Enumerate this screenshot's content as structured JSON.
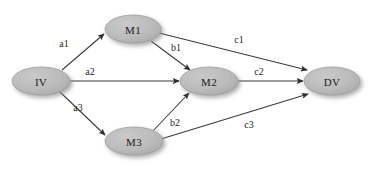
{
  "diagram": {
    "type": "path-analysis-mediation-model",
    "background_color": "#ffffff",
    "node_fill_color": "#b9b9b9",
    "node_stroke_color": "#9a9a9a",
    "edge_color": "#3a3a3a",
    "label_color": "#1a1a1a",
    "nodes": [
      {
        "id": "IV",
        "label": "IV",
        "cx": 41,
        "cy": 81,
        "rx": 29,
        "ry": 14
      },
      {
        "id": "M1",
        "label": "M1",
        "cx": 133,
        "cy": 29,
        "rx": 28,
        "ry": 14
      },
      {
        "id": "M2",
        "label": "M2",
        "cx": 209,
        "cy": 81,
        "rx": 29,
        "ry": 14
      },
      {
        "id": "M3",
        "label": "M3",
        "cx": 134,
        "cy": 141,
        "rx": 29,
        "ry": 14
      },
      {
        "id": "DV",
        "label": "DV",
        "cx": 332,
        "cy": 81,
        "rx": 28,
        "ry": 14
      }
    ],
    "edges": [
      {
        "id": "a1",
        "label": "a1",
        "from": "IV",
        "to": "M1",
        "label_x": 64,
        "label_y": 43,
        "x1": 62,
        "y1": 70,
        "x2": 104,
        "y2": 34
      },
      {
        "id": "a2",
        "label": "a2",
        "from": "IV",
        "to": "M2",
        "label_x": 90,
        "label_y": 71,
        "x1": 70,
        "y1": 81,
        "x2": 179,
        "y2": 81
      },
      {
        "id": "a3",
        "label": "a3",
        "from": "IV",
        "to": "M3",
        "label_x": 78,
        "label_y": 107,
        "x1": 60,
        "y1": 92,
        "x2": 105,
        "y2": 135
      },
      {
        "id": "b1",
        "label": "b1",
        "from": "M1",
        "to": "M2",
        "label_x": 176,
        "label_y": 47,
        "x1": 151,
        "y1": 41,
        "x2": 190,
        "y2": 70
      },
      {
        "id": "b2",
        "label": "b2",
        "from": "M3",
        "to": "M2",
        "label_x": 175,
        "label_y": 122,
        "x1": 152,
        "y1": 132,
        "x2": 189,
        "y2": 93
      },
      {
        "id": "c1",
        "label": "c1",
        "from": "M1",
        "to": "DV",
        "label_x": 239,
        "label_y": 39,
        "x1": 159,
        "y1": 33,
        "x2": 307,
        "y2": 70
      },
      {
        "id": "c2",
        "label": "c2",
        "from": "M2",
        "to": "DV",
        "label_x": 259,
        "label_y": 71,
        "x1": 238,
        "y1": 81,
        "x2": 303,
        "y2": 81
      },
      {
        "id": "c3",
        "label": "c3",
        "from": "M3",
        "to": "DV",
        "label_x": 249,
        "label_y": 124,
        "x1": 161,
        "y1": 139,
        "x2": 308,
        "y2": 94
      }
    ]
  }
}
